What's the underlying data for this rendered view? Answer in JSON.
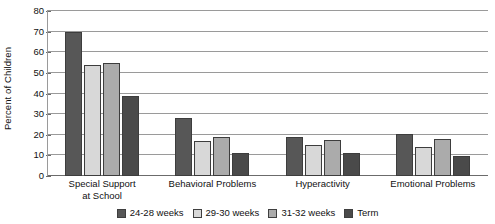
{
  "chart_data": {
    "type": "bar",
    "title": "",
    "xlabel": "",
    "ylabel": "Percent of Children",
    "ylim": [
      0,
      80
    ],
    "ytick_step": 10,
    "yticks": [
      "0",
      "10",
      "20",
      "30",
      "40",
      "50",
      "60",
      "70",
      "80"
    ],
    "grid": true,
    "legend_position": "bottom",
    "categories": [
      "Special Support at School",
      "Behavioral Problems",
      "Hyperactivity",
      "Emotional Problems"
    ],
    "category_labels": [
      {
        "line1": "Special Support",
        "line2": "at School"
      },
      {
        "line1": "Behavioral Problems",
        "line2": ""
      },
      {
        "line1": "Hyperactivity",
        "line2": ""
      },
      {
        "line1": "Emotional Problems",
        "line2": ""
      }
    ],
    "series": [
      {
        "name": "24-28 weeks",
        "color": "#575757",
        "values": [
          70,
          28,
          19,
          20.5
        ]
      },
      {
        "name": "29-30 weeks",
        "color": "#d8d8d8",
        "values": [
          54,
          17,
          15,
          14
        ]
      },
      {
        "name": "31-32 weeks",
        "color": "#ababab",
        "values": [
          55,
          19,
          17.5,
          18
        ]
      },
      {
        "name": "Term",
        "color": "#4a4a4a",
        "values": [
          39,
          11,
          11,
          9.5
        ]
      }
    ]
  },
  "legend": {
    "items": [
      {
        "label": "24-28 weeks",
        "color": "#575757"
      },
      {
        "label": "29-30 weeks",
        "color": "#d8d8d8"
      },
      {
        "label": "31-32 weeks",
        "color": "#ababab"
      },
      {
        "label": "Term",
        "color": "#4a4a4a"
      }
    ]
  }
}
